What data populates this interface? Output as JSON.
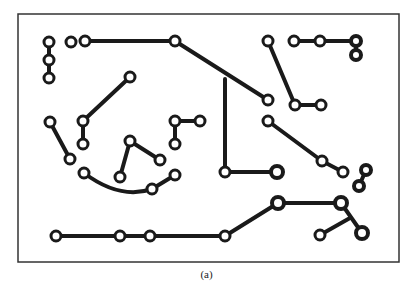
{
  "caption": "(a)",
  "colors": {
    "trace": "#1a1a1a",
    "frame": "#333333",
    "background": "#ffffff"
  },
  "frame": {
    "x": 18,
    "y": 14,
    "width": 381,
    "height": 248
  },
  "pads": [
    {
      "x": 49,
      "y": 42,
      "r": 5,
      "ring": 3
    },
    {
      "x": 49,
      "y": 60,
      "r": 5,
      "ring": 3
    },
    {
      "x": 49,
      "y": 78,
      "r": 5,
      "ring": 3
    },
    {
      "x": 71,
      "y": 42,
      "r": 5,
      "ring": 3
    },
    {
      "x": 85,
      "y": 41,
      "r": 5,
      "ring": 3
    },
    {
      "x": 175,
      "y": 41,
      "r": 5,
      "ring": 3
    },
    {
      "x": 130,
      "y": 77,
      "r": 5,
      "ring": 3
    },
    {
      "x": 83,
      "y": 121,
      "r": 5,
      "ring": 3
    },
    {
      "x": 83,
      "y": 144,
      "r": 5,
      "ring": 3
    },
    {
      "x": 50,
      "y": 122,
      "r": 5,
      "ring": 3
    },
    {
      "x": 70,
      "y": 159,
      "r": 5,
      "ring": 3
    },
    {
      "x": 130,
      "y": 141,
      "r": 5,
      "ring": 3
    },
    {
      "x": 120,
      "y": 177,
      "r": 5,
      "ring": 3
    },
    {
      "x": 160,
      "y": 160,
      "r": 5,
      "ring": 3
    },
    {
      "x": 175,
      "y": 121,
      "r": 5,
      "ring": 3
    },
    {
      "x": 200,
      "y": 121,
      "r": 5,
      "ring": 3
    },
    {
      "x": 175,
      "y": 144,
      "r": 5,
      "ring": 3
    },
    {
      "x": 84,
      "y": 173,
      "r": 5,
      "ring": 3
    },
    {
      "x": 152,
      "y": 189,
      "r": 5,
      "ring": 3
    },
    {
      "x": 175,
      "y": 175,
      "r": 5,
      "ring": 3
    },
    {
      "x": 268,
      "y": 41,
      "r": 5,
      "ring": 3
    },
    {
      "x": 294,
      "y": 41,
      "r": 5,
      "ring": 3
    },
    {
      "x": 320,
      "y": 41,
      "r": 5,
      "ring": 3
    },
    {
      "x": 356,
      "y": 41,
      "r": 5,
      "ring": 4
    },
    {
      "x": 356,
      "y": 55,
      "r": 5,
      "ring": 4
    },
    {
      "x": 268,
      "y": 100,
      "r": 5,
      "ring": 3
    },
    {
      "x": 295,
      "y": 105,
      "r": 5,
      "ring": 3
    },
    {
      "x": 321,
      "y": 105,
      "r": 5,
      "ring": 3
    },
    {
      "x": 268,
      "y": 121,
      "r": 5,
      "ring": 3
    },
    {
      "x": 322,
      "y": 161,
      "r": 5,
      "ring": 3
    },
    {
      "x": 343,
      "y": 172,
      "r": 5,
      "ring": 3
    },
    {
      "x": 366,
      "y": 170,
      "r": 5,
      "ring": 4
    },
    {
      "x": 359,
      "y": 186,
      "r": 5,
      "ring": 4
    },
    {
      "x": 225,
      "y": 172,
      "r": 5,
      "ring": 3
    },
    {
      "x": 277,
      "y": 172,
      "r": 6,
      "ring": 4
    },
    {
      "x": 278,
      "y": 203,
      "r": 6,
      "ring": 4
    },
    {
      "x": 341,
      "y": 203,
      "r": 6,
      "ring": 4
    },
    {
      "x": 320,
      "y": 235,
      "r": 5,
      "ring": 3
    },
    {
      "x": 362,
      "y": 233,
      "r": 6,
      "ring": 4
    },
    {
      "x": 56,
      "y": 236,
      "r": 5,
      "ring": 3
    },
    {
      "x": 120,
      "y": 236,
      "r": 5,
      "ring": 3
    },
    {
      "x": 150,
      "y": 236,
      "r": 5,
      "ring": 3
    },
    {
      "x": 225,
      "y": 236,
      "r": 5,
      "ring": 3
    }
  ],
  "traces": [
    "M49 42 L49 78",
    "M85 41 L175 41 L268 100",
    "M225 79 L225 172 L277 172",
    "M130 77 L83 121 L83 144",
    "M50 122 L70 159",
    "M120 177 L130 141 L160 160",
    "M175 144 L175 121 L200 121",
    "M84 173 Q120 200 152 189 L175 175",
    "M268 41 L295 105 L321 105",
    "M294 41 L356 41 L356 55",
    "M268 121 L322 161 L343 172",
    "M366 170 L359 186",
    "M56 236 L225 236 L278 203 L341 203 L362 233",
    "M320 235 L350 218"
  ]
}
